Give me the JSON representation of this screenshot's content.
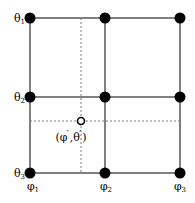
{
  "figure": {
    "width": 195,
    "height": 203,
    "background": "#ffffff",
    "grid_line_color": "#808080",
    "node_color": "#000000",
    "dashed_line_color": "#7a7a7a",
    "marker_fill": "#ffffff",
    "marker_stroke": "#000000"
  },
  "axes": {
    "theta_labels": [
      {
        "text": "θ",
        "sub": "1",
        "x": 25,
        "y": 18
      },
      {
        "text": "θ",
        "sub": "2",
        "x": 25,
        "y": 97
      },
      {
        "text": "θ",
        "sub": "3",
        "x": 25,
        "y": 173
      }
    ],
    "phi_labels": [
      {
        "text": "φ",
        "sub": "1",
        "x": 33,
        "y": 181
      },
      {
        "text": "φ",
        "sub": "2",
        "x": 106,
        "y": 181
      },
      {
        "text": "φ",
        "sub": "3",
        "x": 180,
        "y": 181
      }
    ]
  },
  "grid": {
    "columns_x": [
      30,
      105,
      180
    ],
    "rows_y": [
      18,
      97,
      173
    ],
    "node_radius": 5.5,
    "line_width": 2
  },
  "interpolation_point": {
    "x": 81,
    "y": 121,
    "radius": 3.5,
    "label_open_paren": "(",
    "label_phi": "φ",
    "label_prime_1": "′",
    "label_comma": ",",
    "label_theta": "θ",
    "label_prime_2": "′",
    "label_close_paren": ")",
    "label_x": 71,
    "label_y": 128
  },
  "dashed_lines": {
    "vertical": {
      "x": 81,
      "y1": 18,
      "y2": 173
    },
    "horizontal": {
      "y": 121,
      "x1": 30,
      "x2": 180
    },
    "dash_pattern": "2,2",
    "width": 1
  }
}
